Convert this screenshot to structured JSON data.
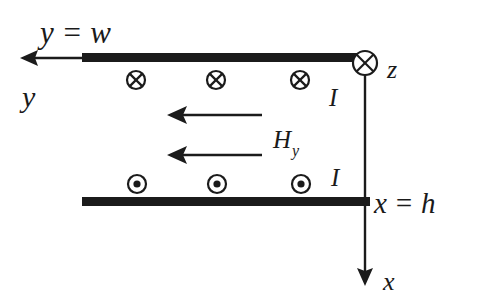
{
  "figure": {
    "background_color": "#ffffff",
    "ink_color": "#1b1b1b"
  },
  "labels": {
    "y_equals_w": "y = w",
    "y_axis": "y",
    "z_axis": "z",
    "x_axis": "x",
    "x_equals_h": "x = h",
    "current_top": "I",
    "current_bottom": "I",
    "field_symbol": "H",
    "field_subscript": "y"
  },
  "geometry": {
    "top_bar": {
      "x": 82,
      "y": 53,
      "width": 288,
      "height": 9
    },
    "bottom_bar": {
      "x": 82,
      "y": 197,
      "width": 288,
      "height": 9
    },
    "y_axis_arrow": {
      "from_x": 82,
      "to_x": 21,
      "y": 58
    },
    "x_axis_arrow": {
      "x": 365,
      "from_y": 64,
      "to_y": 284
    },
    "origin_circle": {
      "cx": 365,
      "cy": 63,
      "r": 12
    }
  },
  "symbols": {
    "current_into_page": {
      "glyph": "cross-in-circle",
      "meaning": "current into page",
      "radius": 9,
      "row_y": 80,
      "positions_x": [
        136,
        216,
        300
      ]
    },
    "current_out_of_page": {
      "glyph": "dot-in-circle",
      "meaning": "current out of page",
      "radius": 9,
      "row_y": 184,
      "positions_x": [
        137,
        217,
        301
      ]
    }
  },
  "field_arrows": [
    {
      "name": "H-arrow-upper",
      "tip_x": 168,
      "tail_x": 262,
      "y": 115,
      "direction": "left"
    },
    {
      "name": "H-arrow-lower",
      "tip_x": 168,
      "tail_x": 262,
      "y": 155,
      "direction": "left"
    }
  ],
  "label_positions": {
    "y_equals_w": {
      "x": 40,
      "y": 43
    },
    "y_axis": {
      "x": 22,
      "y": 107
    },
    "z_axis": {
      "x": 387,
      "y": 78
    },
    "x_axis": {
      "x": 383,
      "y": 290
    },
    "x_equals_h": {
      "x": 374,
      "y": 213
    },
    "current_top": {
      "x": 329,
      "y": 106
    },
    "current_bottom": {
      "x": 331,
      "y": 186
    },
    "field_symbol": {
      "x": 273,
      "y": 148
    }
  }
}
